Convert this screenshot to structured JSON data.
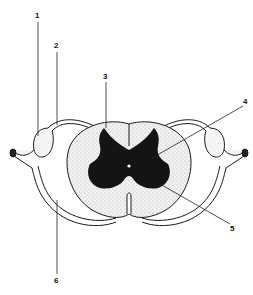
{
  "diagram": {
    "background": "#ffffff",
    "ink": "#1a1a1a",
    "grey_matter_color": "#141414",
    "white_matter_fill": "#e6e6e6",
    "labels": [
      {
        "id": "1",
        "text": "1",
        "x": 36,
        "y": 14
      },
      {
        "id": "2",
        "text": "2",
        "x": 55,
        "y": 44
      },
      {
        "id": "3",
        "text": "3",
        "x": 104,
        "y": 74
      },
      {
        "id": "4",
        "text": "4",
        "x": 244,
        "y": 100
      },
      {
        "id": "5",
        "text": "5",
        "x": 231,
        "y": 226
      },
      {
        "id": "6",
        "text": "6",
        "x": 55,
        "y": 278
      }
    ]
  }
}
